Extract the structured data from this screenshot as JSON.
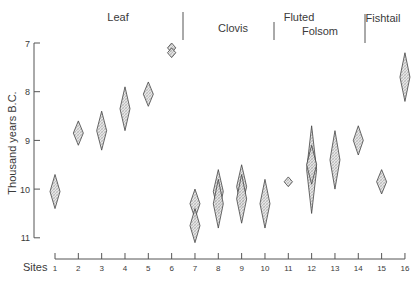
{
  "chart_data": {
    "type": "scatter",
    "title": "",
    "xlabel": "Sites",
    "ylabel": "Thousand years B.C.",
    "ylim": [
      7,
      11
    ],
    "y_inverted": true,
    "y_ticks": [
      7,
      8,
      9,
      10,
      11
    ],
    "x_ticks": [
      1,
      2,
      3,
      4,
      5,
      6,
      7,
      8,
      9,
      10,
      11,
      12,
      13,
      14,
      15,
      16
    ],
    "grid": false,
    "legend": null,
    "marker": "diamond (date range with central estimate)",
    "cultural_periods": [
      {
        "label": "Leaf",
        "sites": [
          1,
          6
        ]
      },
      {
        "label": "Clovis",
        "sites": [
          7,
          10
        ]
      },
      {
        "label": "Fluted",
        "sites": [
          10,
          11
        ]
      },
      {
        "label": "Folsom",
        "sites": [
          11,
          14
        ]
      },
      {
        "label": "Fishtail",
        "sites": [
          14,
          16
        ]
      }
    ],
    "points": [
      {
        "site": 1,
        "ranges": [
          [
            9.7,
            10.4
          ]
        ]
      },
      {
        "site": 2,
        "ranges": [
          [
            8.6,
            9.1
          ]
        ]
      },
      {
        "site": 3,
        "ranges": [
          [
            8.4,
            9.2
          ]
        ]
      },
      {
        "site": 4,
        "ranges": [
          [
            7.9,
            8.8
          ]
        ]
      },
      {
        "site": 5,
        "ranges": [
          [
            7.8,
            8.3
          ]
        ]
      },
      {
        "site": 6,
        "ranges": [
          [
            7.0,
            7.2
          ],
          [
            7.1,
            7.3
          ]
        ]
      },
      {
        "site": 7,
        "ranges": [
          [
            10.0,
            10.6
          ],
          [
            10.4,
            11.1
          ]
        ]
      },
      {
        "site": 8,
        "ranges": [
          [
            9.6,
            10.5
          ],
          [
            9.8,
            10.8
          ]
        ]
      },
      {
        "site": 9,
        "ranges": [
          [
            9.5,
            10.4
          ],
          [
            9.7,
            10.7
          ]
        ]
      },
      {
        "site": 10,
        "ranges": [
          [
            9.8,
            10.8
          ]
        ]
      },
      {
        "site": 11,
        "ranges": [
          [
            9.75,
            9.95
          ]
        ]
      },
      {
        "site": 12,
        "ranges": [
          [
            8.7,
            10.5
          ],
          [
            9.1,
            9.9
          ]
        ]
      },
      {
        "site": 13,
        "ranges": [
          [
            8.8,
            10.0
          ]
        ]
      },
      {
        "site": 14,
        "ranges": [
          [
            8.7,
            9.3
          ]
        ]
      },
      {
        "site": 15,
        "ranges": [
          [
            9.6,
            10.1
          ]
        ]
      },
      {
        "site": 16,
        "ranges": [
          [
            7.2,
            8.2
          ]
        ]
      }
    ]
  }
}
